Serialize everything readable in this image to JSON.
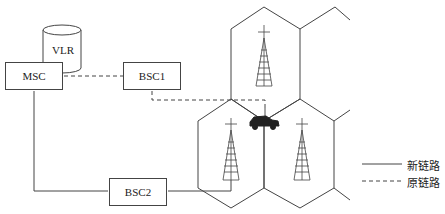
{
  "nodes": {
    "msc": "MSC",
    "vlr": "VLR",
    "bsc1": "BSC1",
    "bsc2": "BSC2"
  },
  "legend": {
    "new_link": "新链路",
    "old_link": "原链路"
  },
  "icons": {
    "base_station": "tower-icon",
    "mobile": "car-icon",
    "database": "cylinder-icon"
  },
  "colors": {
    "line": "#444444",
    "background": "#ffffff"
  }
}
